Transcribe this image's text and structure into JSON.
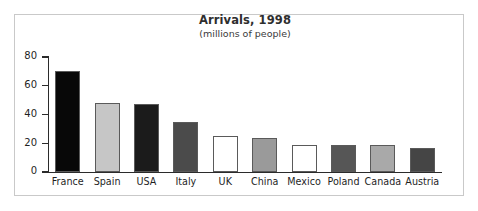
{
  "figure": {
    "title": "Arrivals, 1998",
    "subtitle": "(millions of people)"
  },
  "chart_data": {
    "type": "bar",
    "title": "Arrivals, 1998",
    "subtitle": "(millions of people)",
    "xlabel": "",
    "ylabel": "",
    "ylim": [
      0,
      80
    ],
    "yticks": [
      0,
      20,
      40,
      60,
      80
    ],
    "grid": false,
    "legend": "none",
    "categories": [
      "France",
      "Spain",
      "USA",
      "Italy",
      "UK",
      "China",
      "Mexico",
      "Poland",
      "Canada",
      "Austria"
    ],
    "values": [
      70,
      48,
      47,
      35,
      25,
      24,
      19,
      19,
      19,
      17
    ],
    "bar_colors": [
      "#080808",
      "#c6c6c6",
      "#1b1b1b",
      "#4b4b4b",
      "#ffffff",
      "#9a9a9a",
      "#ffffff",
      "#565656",
      "#a9a9a9",
      "#454545"
    ]
  },
  "colors": {
    "frame": "#c9c9c9",
    "axis": "#2b2b2b",
    "bar_outline": "#5a5a5a",
    "text": "#1f1f1f",
    "title": "#2e2e2e",
    "background": "#ffffff"
  }
}
